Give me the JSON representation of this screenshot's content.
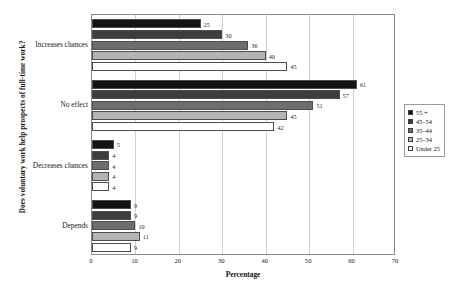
{
  "chart_data": {
    "type": "bar",
    "orientation": "horizontal",
    "title": "",
    "xlabel": "Percentage",
    "ylabel": "Does voluntary work help prospects of full-time work?",
    "categories": [
      "Increases chances",
      "No effect",
      "Decreases chances",
      "Depends"
    ],
    "series": [
      {
        "name": "55 +",
        "color": "#141414",
        "values": [
          25,
          61,
          5,
          9
        ]
      },
      {
        "name": "45–54",
        "color": "#3d3d3d",
        "values": [
          30,
          57,
          4,
          9
        ]
      },
      {
        "name": "35–44",
        "color": "#6e6e6e",
        "values": [
          36,
          51,
          4,
          10
        ]
      },
      {
        "name": "25–34",
        "color": "#b4b4b4",
        "values": [
          40,
          45,
          4,
          11
        ]
      },
      {
        "name": "Under 25",
        "color": "#ffffff",
        "values": [
          45,
          42,
          4,
          9
        ]
      }
    ],
    "xlim": [
      0,
      70
    ],
    "xticks": [
      0,
      10,
      20,
      30,
      40,
      50,
      60,
      70
    ],
    "grid": true,
    "grid_axis": "x",
    "legend_position": "right",
    "value_labels": true
  },
  "legend": {
    "items": [
      "55 +",
      "45–54",
      "35–44",
      "25–34",
      "Under 25"
    ]
  }
}
